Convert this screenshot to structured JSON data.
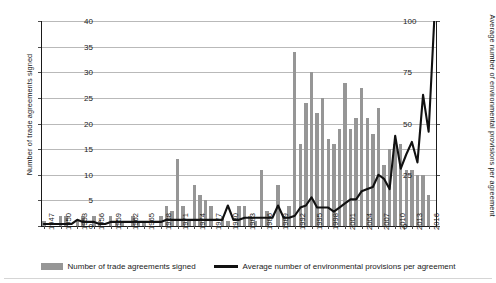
{
  "chart_data": {
    "type": "bar",
    "title": "",
    "xlabel": "",
    "ylabel": "Number of trade agreements signed",
    "ylabel_right": "Average number of environmental provisions per agreement",
    "ylim": [
      0,
      40
    ],
    "ylim_right": [
      0,
      100
    ],
    "yticks": [
      0,
      5,
      10,
      15,
      20,
      25,
      30,
      35,
      40
    ],
    "yticks_right": [
      0,
      25,
      50,
      75,
      100
    ],
    "grid": true,
    "legend_position": "bottom",
    "x": [
      1947,
      1948,
      1949,
      1950,
      1951,
      1952,
      1953,
      1954,
      1955,
      1956,
      1957,
      1958,
      1959,
      1960,
      1961,
      1962,
      1963,
      1964,
      1965,
      1966,
      1967,
      1968,
      1969,
      1970,
      1971,
      1972,
      1973,
      1974,
      1975,
      1976,
      1977,
      1978,
      1979,
      1980,
      1981,
      1982,
      1983,
      1984,
      1985,
      1986,
      1987,
      1988,
      1989,
      1990,
      1991,
      1992,
      1993,
      1994,
      1995,
      1996,
      1997,
      1998,
      1999,
      2000,
      2001,
      2002,
      2003,
      2004,
      2005,
      2006,
      2007,
      2008,
      2009,
      2010,
      2011,
      2012,
      2013,
      2014,
      2015,
      2016,
      2017
    ],
    "xtick_labels": [
      "1947",
      "1950",
      "1953",
      "1956",
      "1959",
      "1962",
      "1965",
      "1968",
      "1971",
      "1974",
      "1977",
      "1980",
      "1983",
      "1986",
      "1989",
      "1992",
      "1995",
      "1998",
      "2001",
      "2004",
      "2007",
      "2010",
      "2013",
      "2016"
    ],
    "xtick_values": [
      1947,
      1950,
      1953,
      1956,
      1959,
      1962,
      1965,
      1968,
      1971,
      1974,
      1977,
      1980,
      1983,
      1986,
      1989,
      1992,
      1995,
      1998,
      2001,
      2004,
      2007,
      2010,
      2013,
      2016
    ],
    "series": [
      {
        "name": "Number of trade agreements signed",
        "type": "bar",
        "color": "#969696",
        "axis": "left",
        "values": [
          1,
          0,
          0,
          2,
          2,
          0,
          1,
          2,
          0,
          2,
          1,
          0,
          2,
          1,
          1,
          0,
          2,
          1,
          1,
          0,
          0,
          2,
          4,
          3,
          13,
          4,
          1,
          8,
          6,
          5,
          4,
          0,
          2,
          1,
          0,
          4,
          4,
          2,
          1,
          11,
          3,
          0,
          8,
          2,
          4,
          34,
          16,
          24,
          30,
          22,
          25,
          17,
          16,
          19,
          28,
          19,
          21,
          27,
          21,
          18,
          23,
          12,
          15,
          16,
          16,
          11,
          11,
          10,
          10,
          6,
          0
        ]
      },
      {
        "name": "Average number of environmental provisions per agreement",
        "type": "line",
        "color": "#111111",
        "axis": "right",
        "values": [
          1,
          1,
          1,
          1,
          1,
          1,
          3,
          2,
          2,
          2,
          1,
          1,
          2,
          2,
          2,
          2,
          2,
          2,
          2,
          2,
          2,
          2,
          3,
          3,
          3,
          3,
          3,
          3,
          3,
          3,
          3,
          3,
          3,
          10,
          3,
          3,
          4,
          4,
          4,
          4,
          4,
          4,
          10,
          4,
          4,
          5,
          9,
          10,
          14,
          9,
          9,
          9,
          7,
          9,
          11,
          13,
          13,
          17,
          18,
          19,
          25,
          23,
          18,
          44,
          28,
          35,
          41,
          31,
          64,
          46,
          100
        ]
      }
    ]
  },
  "legend": {
    "items": [
      {
        "label": "Number of trade agreements signed",
        "marker": "bar",
        "color": "#969696"
      },
      {
        "label": "Average number of environmental provisions per agreement",
        "marker": "line",
        "color": "#111111"
      }
    ]
  }
}
